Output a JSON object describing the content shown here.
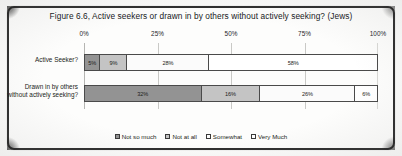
{
  "figure": {
    "title": "Figure 6.6, Active seekers or drawn in by others without actively seeking? (Jews)"
  },
  "legend": {
    "items": [
      {
        "label": "Not so much",
        "color": "#939393"
      },
      {
        "label": "Not at all",
        "color": "#c4c4c4"
      },
      {
        "label": "Somewhat",
        "color": "#fbfbfb"
      },
      {
        "label": "Very Much",
        "color": "#ffffff"
      }
    ]
  },
  "chart_data": {
    "type": "bar",
    "orientation": "horizontal",
    "stacked": true,
    "stack_mode": "percent",
    "title": "Figure 6.6, Active seekers or drawn in by others without actively seeking? (Jews)",
    "xlabel": "",
    "ylabel": "",
    "xlim": [
      0,
      100
    ],
    "xticks": [
      0,
      25,
      50,
      75,
      100
    ],
    "xtick_labels": [
      "0%",
      "25%",
      "50%",
      "75%",
      "100%"
    ],
    "grid": true,
    "legend_position": "bottom",
    "categories": [
      "Active Seeker?",
      "Drawn in by others without actively seeking?"
    ],
    "series": [
      {
        "name": "Not so much",
        "color": "#939393",
        "values": [
          5,
          32
        ]
      },
      {
        "name": "Not at all",
        "color": "#c4c4c4",
        "values": [
          9,
          16
        ]
      },
      {
        "name": "Somewhat",
        "color": "#fbfbfb",
        "values": [
          28,
          26
        ]
      },
      {
        "name": "Very Much",
        "color": "#ffffff",
        "values": [
          58,
          6
        ]
      }
    ],
    "bars": [
      {
        "category": "Active Seeker?",
        "category_line1": "Active Seeker?",
        "category_line2": "",
        "segments": [
          {
            "series": "Not so much",
            "value": 5,
            "label": "5%",
            "color": "#939393"
          },
          {
            "series": "Not at all",
            "value": 9,
            "label": "9%",
            "color": "#c4c4c4"
          },
          {
            "series": "Somewhat",
            "value": 28,
            "label": "28%",
            "color": "#fbfbfb"
          },
          {
            "series": "Very Much",
            "value": 58,
            "label": "58%",
            "color": "#ffffff"
          }
        ]
      },
      {
        "category": "Drawn in by others without actively seeking?",
        "category_line1": "Drawn in by others",
        "category_line2": "without actively seeking?",
        "segments": [
          {
            "series": "Not so much",
            "value": 32,
            "label": "32%",
            "color": "#939393"
          },
          {
            "series": "Not at all",
            "value": 16,
            "label": "16%",
            "color": "#c4c4c4"
          },
          {
            "series": "Somewhat",
            "value": 26,
            "label": "26%",
            "color": "#fbfbfb"
          },
          {
            "series": "Very Much",
            "value": 6,
            "label": "6%",
            "color": "#ffffff"
          }
        ]
      }
    ]
  }
}
